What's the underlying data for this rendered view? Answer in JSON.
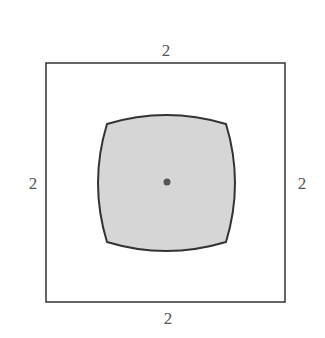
{
  "diagram": {
    "square": {
      "side_labels": {
        "top": "2",
        "bottom": "2",
        "left": "2",
        "right": "2"
      },
      "stroke": "#333333",
      "fill": "#ffffff"
    },
    "inner_region": {
      "shape": "square-with-concave-bulging-sides",
      "fill": "#d6d6d6",
      "stroke": "#333333"
    },
    "center_point": {
      "fill": "#555555"
    }
  }
}
